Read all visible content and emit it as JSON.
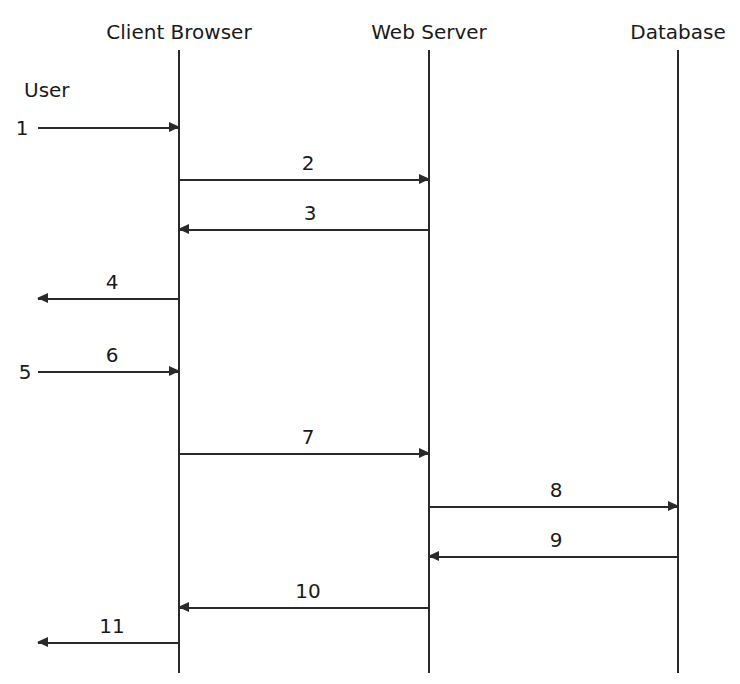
{
  "diagram": {
    "type": "sequence",
    "participants": [
      {
        "id": "client",
        "label": "Client Browser",
        "x": 179,
        "label_x": 179
      },
      {
        "id": "server",
        "label": "Web Server",
        "x": 429,
        "label_x": 429
      },
      {
        "id": "database",
        "label": "Database",
        "x": 678,
        "label_x": 678
      }
    ],
    "actor_label": "User",
    "lifeline_top": 50,
    "lifeline_bottom": 673,
    "messages": [
      {
        "num": "1",
        "from_x": 38,
        "to_x": 179,
        "y": 128,
        "dir": "right",
        "label_pos": "left",
        "label_x": 22,
        "label_y": 118
      },
      {
        "num": "2",
        "from_x": 179,
        "to_x": 429,
        "y": 180,
        "dir": "right",
        "label_pos": "above",
        "label_x": 308,
        "label_y": 153
      },
      {
        "num": "3",
        "from_x": 179,
        "to_x": 429,
        "y": 230,
        "dir": "left",
        "label_pos": "above",
        "label_x": 310,
        "label_y": 203
      },
      {
        "num": "4",
        "from_x": 38,
        "to_x": 179,
        "y": 299,
        "dir": "left",
        "label_pos": "above",
        "label_x": 112,
        "label_y": 272
      },
      {
        "num": "5",
        "from_x": 38,
        "to_x": 179,
        "y": 372,
        "dir": "right",
        "label_pos": "left",
        "label_x": 25,
        "label_y": 362
      },
      {
        "num": "6",
        "from_x": 38,
        "to_x": 179,
        "y": 372,
        "dir": "none",
        "label_pos": "above",
        "label_x": 112,
        "label_y": 345
      },
      {
        "num": "7",
        "from_x": 179,
        "to_x": 429,
        "y": 454,
        "dir": "right",
        "label_pos": "above",
        "label_x": 308,
        "label_y": 427
      },
      {
        "num": "8",
        "from_x": 429,
        "to_x": 678,
        "y": 507,
        "dir": "right",
        "label_pos": "above",
        "label_x": 556,
        "label_y": 480
      },
      {
        "num": "9",
        "from_x": 429,
        "to_x": 678,
        "y": 557,
        "dir": "left",
        "label_pos": "above",
        "label_x": 556,
        "label_y": 530
      },
      {
        "num": "10",
        "from_x": 179,
        "to_x": 429,
        "y": 608,
        "dir": "left",
        "label_pos": "above",
        "label_x": 308,
        "label_y": 581
      },
      {
        "num": "11",
        "from_x": 38,
        "to_x": 179,
        "y": 643,
        "dir": "left",
        "label_pos": "above",
        "label_x": 112,
        "label_y": 616
      }
    ]
  }
}
